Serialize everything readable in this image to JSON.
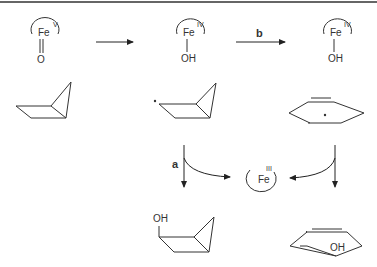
{
  "diagram": {
    "species": {
      "fe_v_oxo": {
        "metal": "Fe",
        "oxidation": "V",
        "ligand": "O"
      },
      "fe_iv_oh_1": {
        "metal": "Fe",
        "oxidation": "IV",
        "ligand": "OH"
      },
      "fe_iv_oh_2": {
        "metal": "Fe",
        "oxidation": "IV",
        "ligand": "OH"
      },
      "fe_iii": {
        "metal": "Fe",
        "oxidation": "III"
      },
      "product_bicyclic_alcohol": {
        "label": "OH"
      },
      "product_cyclopentenol": {
        "label": "OH"
      }
    },
    "arrows": {
      "b_label": "b",
      "a_label": "a"
    }
  }
}
